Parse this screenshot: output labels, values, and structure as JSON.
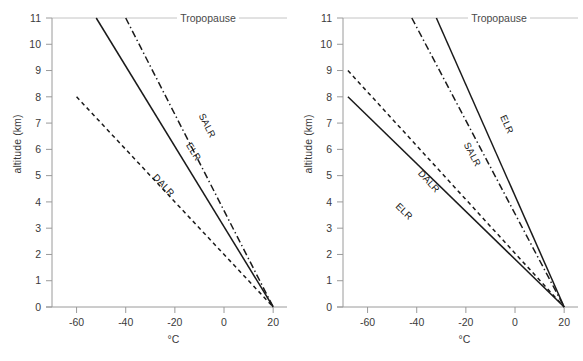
{
  "figure": {
    "panels": [
      {
        "id": "left",
        "name": "stable-atmosphere-panel",
        "axes": {
          "xlabel": "°C",
          "ylabel": "altitude (km)",
          "xlim": [
            -70,
            24
          ],
          "ylim": [
            0,
            11
          ],
          "xticks": [
            -60,
            -40,
            -20,
            0,
            20
          ],
          "xticklabels": [
            "-60",
            "-40",
            "-20",
            "0",
            "20"
          ],
          "yticks": [
            0,
            1,
            2,
            3,
            4,
            5,
            6,
            7,
            8,
            9,
            10,
            11
          ],
          "yticklabels": [
            "0",
            "1",
            "2",
            "3",
            "4",
            "5",
            "6",
            "7",
            "8",
            "9",
            "10",
            "11"
          ],
          "grid": false
        },
        "annotations": [
          {
            "name": "tropopause-label",
            "text": "Tropopause",
            "altitude_km": 11
          }
        ],
        "series": [
          {
            "name": "ELR",
            "label": "ELR",
            "style": "solid",
            "x": [
              -52,
              20
            ],
            "y": [
              11,
              0
            ],
            "label_at": {
              "x": -13.5,
              "y": 5.85
            }
          },
          {
            "name": "SALR",
            "label": "SALR",
            "style": "dash-dot",
            "x": [
              -40,
              20
            ],
            "y": [
              11,
              0
            ],
            "label_at": {
              "x": -8.0,
              "y": 6.85
            }
          },
          {
            "name": "DALR",
            "label": "DALR",
            "style": "dashed",
            "x": [
              -60,
              20
            ],
            "y": [
              8,
              0
            ],
            "label_at": {
              "x": -25.5,
              "y": 4.55
            }
          }
        ]
      },
      {
        "id": "right",
        "name": "unstable-atmosphere-panel",
        "axes": {
          "xlabel": "°C",
          "ylabel": "altitude (km)",
          "xlim": [
            -70,
            24
          ],
          "ylim": [
            0,
            11
          ],
          "xticks": [
            -60,
            -40,
            -20,
            0,
            20
          ],
          "xticklabels": [
            "-60",
            "-40",
            "-20",
            "0",
            "20"
          ],
          "yticks": [
            0,
            1,
            2,
            3,
            4,
            5,
            6,
            7,
            8,
            9,
            10,
            11
          ],
          "yticklabels": [
            "0",
            "1",
            "2",
            "3",
            "4",
            "5",
            "6",
            "7",
            "8",
            "9",
            "10",
            "11"
          ],
          "grid": false
        },
        "annotations": [
          {
            "name": "tropopause-label",
            "text": "Tropopause",
            "altitude_km": 11
          }
        ],
        "series": [
          {
            "name": "ELR-upper",
            "label": "ELR",
            "style": "solid",
            "x": [
              -32,
              20
            ],
            "y": [
              11,
              0
            ],
            "label_at": {
              "x": -4.5,
              "y": 6.9
            }
          },
          {
            "name": "SALR",
            "label": "SALR",
            "style": "dash-dot",
            "x": [
              -42,
              20
            ],
            "y": [
              11,
              0
            ],
            "label_at": {
              "x": -18.5,
              "y": 5.75
            }
          },
          {
            "name": "DALR",
            "label": "DALR",
            "style": "dashed",
            "x": [
              -68,
              20
            ],
            "y": [
              9,
              0
            ],
            "label_at": {
              "x": -36.0,
              "y": 4.7
            }
          },
          {
            "name": "ELR-lower",
            "label": "ELR",
            "style": "solid",
            "x": [
              -68,
              20
            ],
            "y": [
              8,
              0
            ],
            "label_at": {
              "x": -46.0,
              "y": 3.55
            }
          }
        ]
      }
    ]
  },
  "chart_data": {
    "type": "line",
    "title": "",
    "subtitle": "",
    "xlabel": "°C",
    "ylabel": "altitude (km)",
    "xlim": [
      -70,
      24
    ],
    "ylim": [
      0,
      11
    ],
    "xticks": [
      -60,
      -40,
      -20,
      0,
      20
    ],
    "yticks": [
      0,
      1,
      2,
      3,
      4,
      5,
      6,
      7,
      8,
      9,
      10,
      11
    ],
    "grid": false,
    "legend": "inline-line-labels",
    "panel_count": 2,
    "annotations": [
      "Tropopause"
    ],
    "panels": [
      {
        "panel": "left",
        "description": "stable atmosphere: ELR less steep than SALR and DALR",
        "series": [
          {
            "name": "ELR",
            "style": "solid",
            "x": [
              -52,
              20
            ],
            "y": [
              11,
              0
            ],
            "lapse_rate_C_per_km": 6.55,
            "surface_temp_C": 20
          },
          {
            "name": "SALR",
            "style": "dash-dot",
            "x": [
              -40,
              20
            ],
            "y": [
              11,
              0
            ],
            "lapse_rate_C_per_km": 5.45,
            "surface_temp_C": 20
          },
          {
            "name": "DALR",
            "style": "dashed",
            "x": [
              -60,
              20
            ],
            "y": [
              8,
              0
            ],
            "lapse_rate_C_per_km": 10.0,
            "surface_temp_C": 20
          }
        ]
      },
      {
        "panel": "right",
        "description": "unstable atmosphere: two ELR cases shown against SALR and DALR",
        "series": [
          {
            "name": "ELR-upper",
            "style": "solid",
            "x": [
              -32,
              20
            ],
            "y": [
              11,
              0
            ],
            "lapse_rate_C_per_km": 4.73,
            "surface_temp_C": 20
          },
          {
            "name": "SALR",
            "style": "dash-dot",
            "x": [
              -42,
              20
            ],
            "y": [
              11,
              0
            ],
            "lapse_rate_C_per_km": 5.64,
            "surface_temp_C": 20
          },
          {
            "name": "DALR",
            "style": "dashed",
            "x": [
              -68,
              20
            ],
            "y": [
              9,
              0
            ],
            "lapse_rate_C_per_km": 9.78,
            "surface_temp_C": 20
          },
          {
            "name": "ELR-lower",
            "style": "solid",
            "x": [
              -68,
              20
            ],
            "y": [
              8,
              0
            ],
            "lapse_rate_C_per_km": 11.0,
            "surface_temp_C": 20
          }
        ]
      }
    ]
  },
  "colors": {
    "line": "#1a1a1a",
    "axis": "#9a9a9a",
    "text": "#3a3a3a",
    "tropopause": "#c4c4c4",
    "background": "#ffffff"
  }
}
